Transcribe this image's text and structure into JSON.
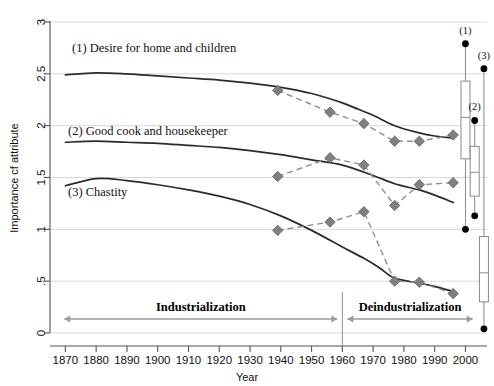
{
  "chart_data": {
    "type": "line",
    "title": "",
    "xlabel": "Year",
    "ylabel": "Importance cf attribute",
    "xlim": [
      1865,
      2007
    ],
    "ylim": [
      0,
      3
    ],
    "yticks": [
      "0",
      ".5",
      "1",
      "1.5",
      "2",
      "2.5",
      "3"
    ],
    "ytick_values": [
      0,
      0.5,
      1,
      1.5,
      2,
      2.5,
      3
    ],
    "xticks": [
      "1870",
      "1880",
      "1890",
      "1900",
      "1910",
      "1920",
      "1930",
      "1940",
      "1950",
      "1960",
      "1970",
      "1980",
      "1990",
      "2000"
    ],
    "xtick_values": [
      1870,
      1880,
      1890,
      1900,
      1910,
      1920,
      1930,
      1940,
      1950,
      1960,
      1970,
      1980,
      1990,
      2000
    ],
    "grid": true,
    "legend_position": "inline-annotations",
    "series": [
      {
        "name": "(1) Desire for home and children",
        "label": "(1) Desire for home and children",
        "kind": "trend",
        "style": "solid-dark",
        "x": [
          1870,
          1880,
          1890,
          1900,
          1910,
          1920,
          1930,
          1940,
          1950,
          1960,
          1965,
          1970,
          1977,
          1985,
          1990,
          1996
        ],
        "values": [
          2.49,
          2.51,
          2.5,
          2.48,
          2.46,
          2.44,
          2.41,
          2.37,
          2.31,
          2.22,
          2.16,
          2.1,
          2.0,
          1.93,
          1.9,
          1.88
        ]
      },
      {
        "name": "(1) observed",
        "label": "(1) Desire for home and children (observed)",
        "kind": "observed",
        "style": "dashed-grey-diamond",
        "x": [
          1939,
          1956,
          1967,
          1977,
          1985,
          1996
        ],
        "values": [
          2.34,
          2.13,
          2.02,
          1.85,
          1.85,
          1.91
        ]
      },
      {
        "name": "(2) Good cook and housekeeper",
        "label": "(2) Good cook and housekeeper",
        "kind": "trend",
        "style": "solid-dark",
        "x": [
          1870,
          1880,
          1890,
          1900,
          1910,
          1920,
          1930,
          1940,
          1950,
          1960,
          1970,
          1977,
          1985,
          1990,
          1996
        ],
        "values": [
          1.84,
          1.85,
          1.84,
          1.83,
          1.81,
          1.79,
          1.76,
          1.72,
          1.67,
          1.62,
          1.52,
          1.44,
          1.38,
          1.33,
          1.26
        ]
      },
      {
        "name": "(2) observed",
        "label": "(2) Good cook and housekeeper (observed)",
        "kind": "observed",
        "style": "dashed-grey-diamond",
        "x": [
          1939,
          1956,
          1967,
          1977,
          1985,
          1996
        ],
        "values": [
          1.51,
          1.69,
          1.62,
          1.23,
          1.43,
          1.45
        ]
      },
      {
        "name": "(3) Chastity",
        "label": "(3) Chastity",
        "kind": "trend",
        "style": "solid-dark",
        "x": [
          1870,
          1880,
          1890,
          1900,
          1910,
          1920,
          1930,
          1940,
          1950,
          1960,
          1967,
          1972,
          1977,
          1985,
          1990,
          1996
        ],
        "values": [
          1.42,
          1.49,
          1.47,
          1.43,
          1.38,
          1.32,
          1.24,
          1.13,
          0.99,
          0.83,
          0.72,
          0.63,
          0.53,
          0.48,
          0.45,
          0.4
        ]
      },
      {
        "name": "(3) observed",
        "label": "(3) Chastity (observed)",
        "kind": "observed",
        "style": "dashed-grey-diamond",
        "x": [
          1939,
          1956,
          1967,
          1977,
          1985,
          1996
        ],
        "values": [
          0.99,
          1.07,
          1.17,
          0.5,
          0.49,
          0.38
        ]
      }
    ],
    "annotations": [
      {
        "name": "industrialization",
        "text": "Industrialization",
        "x_start": 1868,
        "x_end": 1960
      },
      {
        "name": "deindustrialization",
        "text": "Deindustrialization",
        "x_start": 1960,
        "x_end": 2004
      }
    ],
    "boxplots": [
      {
        "name": "(1)",
        "label": "(1)",
        "x": 2000,
        "upper_dot": 2.79,
        "lower_dot": 1.0,
        "whisker_top": 2.79,
        "whisker_bottom": 1.0,
        "box_top": 2.43,
        "box_bottom": 1.68,
        "median": 2.08
      },
      {
        "name": "(2)",
        "label": "(2)",
        "x": 2003,
        "upper_dot": 2.05,
        "lower_dot": 1.13,
        "whisker_top": 2.05,
        "whisker_bottom": 1.13,
        "box_top": 1.8,
        "box_bottom": 1.32,
        "median": 1.55
      },
      {
        "name": "(3)",
        "label": "(3)",
        "x": 2006,
        "upper_dot": 2.55,
        "lower_dot": 0.04,
        "whisker_top": 2.55,
        "whisker_bottom": 0.04,
        "box_top": 0.93,
        "box_bottom": 0.3,
        "median": 0.58
      }
    ]
  },
  "labels": {
    "series1": "(1) Desire for home and children",
    "series2": "(2) Good cook and housekeeper",
    "series3": "(3) Chastity",
    "industrialization": "Industrialization",
    "deindustrialization": "Deindustrialization",
    "ylabel": "Importance cf attribute",
    "xlabel": "Year",
    "box1": "(1)",
    "box2": "(2)",
    "box3": "(3)"
  },
  "colors": {
    "trend": "#2b2b2b",
    "observed": "#8f8f8f",
    "marker": "#808080",
    "grid": "#d9d9d9",
    "axis": "#555555",
    "era": "#9a9a9a"
  }
}
